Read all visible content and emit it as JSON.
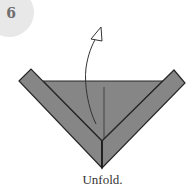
{
  "step": {
    "number": "6",
    "caption": "Unfold."
  },
  "diagram": {
    "icons": [
      "step-number-badge",
      "curved-unfold-arrow",
      "folded-paper-v-shape"
    ],
    "colors": {
      "paper_fill": "#868686",
      "paper_outline": "#262626",
      "badge_bg": "#e8e8e8",
      "badge_text": "#6e6e6e",
      "arrow_stroke": "#333333",
      "caption_text": "#333333"
    }
  }
}
